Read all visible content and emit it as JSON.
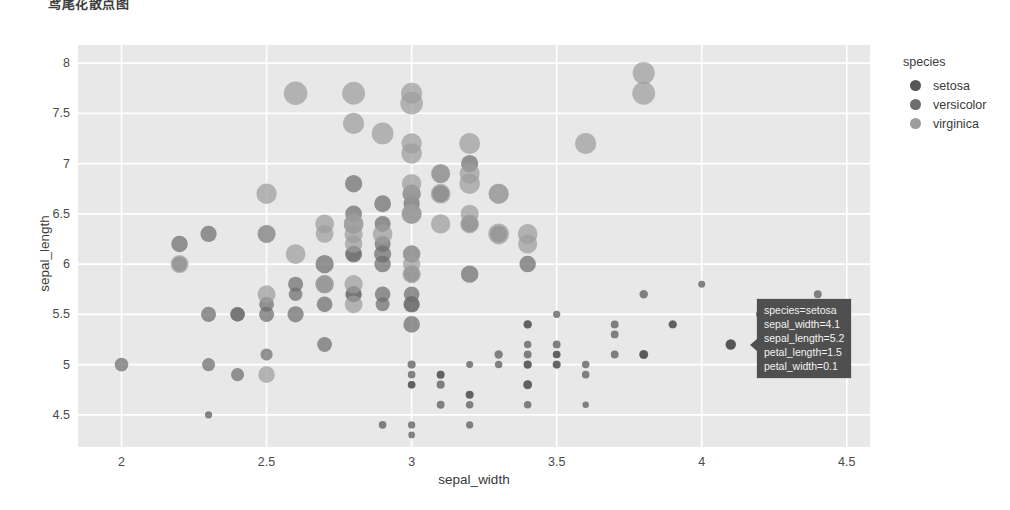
{
  "title": "鸢尾花散点图",
  "axes": {
    "x": {
      "label": "sepal_width",
      "ticks": [
        "2",
        "2.5",
        "3",
        "3.5",
        "4",
        "4.5"
      ],
      "tickvals": [
        2,
        2.5,
        3,
        3.5,
        4,
        4.5
      ],
      "range": [
        1.85,
        4.58
      ]
    },
    "y": {
      "label": "sepal_length",
      "ticks": [
        "4.5",
        "5",
        "5.5",
        "6",
        "6.5",
        "7",
        "7.5",
        "8"
      ],
      "tickvals": [
        4.5,
        5,
        5.5,
        6,
        6.5,
        7,
        7.5,
        8
      ],
      "range": [
        4.18,
        8.18
      ]
    }
  },
  "legend": {
    "title": "species",
    "items": [
      {
        "label": "setosa",
        "color": "#565656"
      },
      {
        "label": "versicolor",
        "color": "#6e6e6e"
      },
      {
        "label": "virginica",
        "color": "#9d9d9d"
      }
    ]
  },
  "tooltip": {
    "lines": [
      "species=setosa",
      "sepal_width=4.1",
      "sepal_length=5.2",
      "petal_length=1.5",
      "petal_width=0.1"
    ],
    "bg": "#4f4f4f",
    "point": {
      "sepal_width": 4.1,
      "sepal_length": 5.2
    }
  },
  "style": {
    "plot_bg": "#e8e8e8",
    "paper_bg": "#ffffff",
    "gridline": "#ffffff"
  },
  "chart_data": {
    "type": "scatter",
    "title": "鸢尾花散点图",
    "xlabel": "sepal_width",
    "ylabel": "sepal_length",
    "xlim": [
      1.85,
      4.58
    ],
    "ylim": [
      4.18,
      8.18
    ],
    "grid": true,
    "legend_position": "right",
    "size_encoding": "petal_length",
    "color_encoding": "species",
    "opacity": 0.72,
    "series": [
      {
        "name": "setosa",
        "color": "#565656",
        "points": [
          [
            3.5,
            5.1,
            1.4
          ],
          [
            3.0,
            4.9,
            1.4
          ],
          [
            3.2,
            4.7,
            1.3
          ],
          [
            3.1,
            4.6,
            1.5
          ],
          [
            3.6,
            5.0,
            1.4
          ],
          [
            3.9,
            5.4,
            1.7
          ],
          [
            3.4,
            4.6,
            1.4
          ],
          [
            3.4,
            5.0,
            1.5
          ],
          [
            2.9,
            4.4,
            1.4
          ],
          [
            3.1,
            4.9,
            1.5
          ],
          [
            3.7,
            5.4,
            1.5
          ],
          [
            3.4,
            4.8,
            1.6
          ],
          [
            3.0,
            4.8,
            1.4
          ],
          [
            3.0,
            4.3,
            1.1
          ],
          [
            4.0,
            5.8,
            1.2
          ],
          [
            4.4,
            5.7,
            1.5
          ],
          [
            3.9,
            5.4,
            1.3
          ],
          [
            3.5,
            5.1,
            1.4
          ],
          [
            3.8,
            5.7,
            1.7
          ],
          [
            3.8,
            5.1,
            1.5
          ],
          [
            3.4,
            5.4,
            1.7
          ],
          [
            3.7,
            5.1,
            1.5
          ],
          [
            3.6,
            4.6,
            1.0
          ],
          [
            3.3,
            5.1,
            1.7
          ],
          [
            3.4,
            4.8,
            1.9
          ],
          [
            3.0,
            5.0,
            1.6
          ],
          [
            3.4,
            5.0,
            1.6
          ],
          [
            3.5,
            5.2,
            1.5
          ],
          [
            3.4,
            5.2,
            1.4
          ],
          [
            3.2,
            4.7,
            1.6
          ],
          [
            3.1,
            4.8,
            1.6
          ],
          [
            3.4,
            5.4,
            1.5
          ],
          [
            4.1,
            5.2,
            1.5
          ],
          [
            4.2,
            5.5,
            1.4
          ],
          [
            3.1,
            4.9,
            1.5
          ],
          [
            3.2,
            5.0,
            1.2
          ],
          [
            3.5,
            5.5,
            1.3
          ],
          [
            3.6,
            4.9,
            1.4
          ],
          [
            3.0,
            4.4,
            1.3
          ],
          [
            3.4,
            5.1,
            1.5
          ],
          [
            3.5,
            5.0,
            1.3
          ],
          [
            2.3,
            4.5,
            1.3
          ],
          [
            3.2,
            4.4,
            1.3
          ],
          [
            3.5,
            5.0,
            1.6
          ],
          [
            3.8,
            5.1,
            1.9
          ],
          [
            3.0,
            4.8,
            1.4
          ],
          [
            3.8,
            5.1,
            1.6
          ],
          [
            3.2,
            4.6,
            1.4
          ],
          [
            3.7,
            5.3,
            1.5
          ],
          [
            3.3,
            5.0,
            1.4
          ]
        ]
      },
      {
        "name": "versicolor",
        "color": "#6e6e6e",
        "points": [
          [
            3.2,
            7.0,
            4.7
          ],
          [
            3.2,
            6.4,
            4.5
          ],
          [
            3.1,
            6.9,
            4.9
          ],
          [
            2.3,
            5.5,
            4.0
          ],
          [
            2.8,
            6.5,
            4.6
          ],
          [
            2.8,
            5.7,
            4.5
          ],
          [
            3.3,
            6.3,
            4.7
          ],
          [
            2.4,
            4.9,
            3.3
          ],
          [
            2.9,
            6.6,
            4.6
          ],
          [
            2.7,
            5.2,
            3.9
          ],
          [
            2.0,
            5.0,
            3.5
          ],
          [
            3.0,
            5.9,
            4.2
          ],
          [
            2.2,
            6.0,
            4.0
          ],
          [
            2.9,
            6.1,
            4.7
          ],
          [
            2.9,
            5.6,
            3.6
          ],
          [
            3.1,
            6.7,
            4.4
          ],
          [
            3.0,
            5.6,
            4.5
          ],
          [
            2.7,
            5.8,
            4.1
          ],
          [
            2.2,
            6.2,
            4.5
          ],
          [
            2.5,
            5.6,
            3.9
          ],
          [
            3.2,
            5.9,
            4.8
          ],
          [
            2.8,
            6.1,
            4.0
          ],
          [
            2.5,
            6.3,
            4.9
          ],
          [
            2.8,
            6.1,
            4.7
          ],
          [
            2.9,
            6.4,
            4.3
          ],
          [
            3.0,
            6.6,
            4.4
          ],
          [
            2.8,
            6.8,
            4.8
          ],
          [
            3.0,
            6.7,
            5.0
          ],
          [
            2.9,
            6.0,
            4.5
          ],
          [
            2.6,
            5.7,
            3.5
          ],
          [
            2.4,
            5.5,
            3.8
          ],
          [
            2.4,
            5.5,
            3.7
          ],
          [
            2.7,
            5.8,
            3.9
          ],
          [
            2.7,
            6.0,
            5.1
          ],
          [
            3.0,
            5.4,
            4.5
          ],
          [
            3.4,
            6.0,
            4.5
          ],
          [
            3.1,
            6.7,
            4.7
          ],
          [
            2.3,
            6.3,
            4.4
          ],
          [
            3.0,
            5.6,
            4.1
          ],
          [
            2.5,
            5.5,
            4.0
          ],
          [
            2.6,
            5.5,
            4.4
          ],
          [
            3.0,
            6.1,
            4.6
          ],
          [
            2.6,
            5.8,
            4.0
          ],
          [
            2.3,
            5.0,
            3.3
          ],
          [
            2.7,
            5.6,
            4.2
          ],
          [
            3.0,
            5.7,
            4.2
          ],
          [
            2.9,
            5.7,
            4.2
          ],
          [
            2.9,
            6.2,
            4.3
          ],
          [
            2.5,
            5.1,
            3.0
          ],
          [
            2.8,
            5.7,
            4.1
          ]
        ]
      },
      {
        "name": "virginica",
        "color": "#9d9d9d",
        "points": [
          [
            3.3,
            6.3,
            6.0
          ],
          [
            2.7,
            5.8,
            5.1
          ],
          [
            3.0,
            7.1,
            5.9
          ],
          [
            2.9,
            6.3,
            5.6
          ],
          [
            3.0,
            6.5,
            5.8
          ],
          [
            3.0,
            7.6,
            6.6
          ],
          [
            2.5,
            4.9,
            4.5
          ],
          [
            2.9,
            7.3,
            6.3
          ],
          [
            2.5,
            6.7,
            5.8
          ],
          [
            3.6,
            7.2,
            6.1
          ],
          [
            3.2,
            6.5,
            5.1
          ],
          [
            2.7,
            6.4,
            5.3
          ],
          [
            3.0,
            6.8,
            5.5
          ],
          [
            2.5,
            5.7,
            5.0
          ],
          [
            2.8,
            5.8,
            5.1
          ],
          [
            3.2,
            6.4,
            5.3
          ],
          [
            3.0,
            6.5,
            5.5
          ],
          [
            3.8,
            7.7,
            6.7
          ],
          [
            2.6,
            7.7,
            6.9
          ],
          [
            2.2,
            6.0,
            5.0
          ],
          [
            3.2,
            6.9,
            5.7
          ],
          [
            2.8,
            5.6,
            4.9
          ],
          [
            2.8,
            7.7,
            6.7
          ],
          [
            2.7,
            6.3,
            4.9
          ],
          [
            3.3,
            6.7,
            5.7
          ],
          [
            3.2,
            7.2,
            6.0
          ],
          [
            2.8,
            6.2,
            4.8
          ],
          [
            3.0,
            6.1,
            4.9
          ],
          [
            2.8,
            6.4,
            5.6
          ],
          [
            3.0,
            7.2,
            5.8
          ],
          [
            2.8,
            7.4,
            6.1
          ],
          [
            3.8,
            7.9,
            6.4
          ],
          [
            2.8,
            6.4,
            5.6
          ],
          [
            2.8,
            6.3,
            5.1
          ],
          [
            2.6,
            6.1,
            5.6
          ],
          [
            3.0,
            7.7,
            6.1
          ],
          [
            3.4,
            6.3,
            5.6
          ],
          [
            3.1,
            6.4,
            5.5
          ],
          [
            3.0,
            6.0,
            4.8
          ],
          [
            3.1,
            6.9,
            5.4
          ],
          [
            3.1,
            6.7,
            5.6
          ],
          [
            3.1,
            6.9,
            5.1
          ],
          [
            2.7,
            5.8,
            5.1
          ],
          [
            3.2,
            6.8,
            5.9
          ],
          [
            3.3,
            6.7,
            5.7
          ],
          [
            3.0,
            6.7,
            5.2
          ],
          [
            2.5,
            6.3,
            5.0
          ],
          [
            3.0,
            6.5,
            5.2
          ],
          [
            3.4,
            6.2,
            5.4
          ],
          [
            3.0,
            5.9,
            5.1
          ]
        ]
      }
    ]
  }
}
